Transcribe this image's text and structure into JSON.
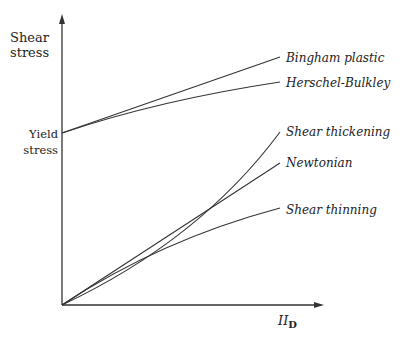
{
  "diagram": {
    "y_axis_label_line1": "Shear",
    "y_axis_label_line2": "stress",
    "yield_label_line1": "Yield",
    "yield_label_line2": "stress",
    "x_axis_label_main": "II",
    "x_axis_label_sub": "D",
    "curves": [
      {
        "name": "Bingham plastic",
        "start": "yield",
        "shape": "linear"
      },
      {
        "name": "Herschel-Bulkley",
        "start": "yield",
        "shape": "concave"
      },
      {
        "name": "Shear thickening",
        "start": "origin",
        "shape": "convex"
      },
      {
        "name": "Newtonian",
        "start": "origin",
        "shape": "linear"
      },
      {
        "name": "Shear thinning",
        "start": "origin",
        "shape": "concave"
      }
    ],
    "line_color": "#333333"
  }
}
